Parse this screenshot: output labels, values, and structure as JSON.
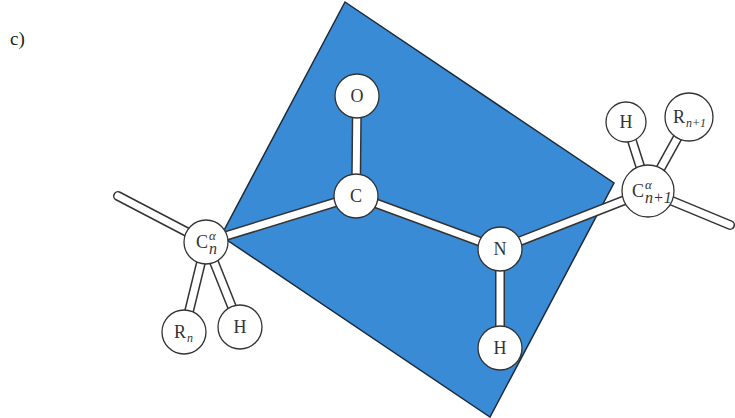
{
  "panel_label": "c)",
  "colors": {
    "peptide_plane": "#3a8bd6",
    "plane_outline": "#1c2a3a",
    "atom_fill": "#ffffff",
    "atom_stroke": "#333333",
    "bond_fill": "#ffffff"
  },
  "plane": {
    "name": "peptide-plane",
    "corners": [
      [
        345,
        2
      ],
      [
        614,
        183
      ],
      [
        490,
        417
      ],
      [
        221,
        236
      ]
    ]
  },
  "atoms": [
    {
      "id": "ca_n",
      "label": "C",
      "sup": "α",
      "sub": "n",
      "x": 206,
      "y": 242,
      "r": 22
    },
    {
      "id": "c",
      "label": "C",
      "x": 356,
      "y": 196,
      "r": 22
    },
    {
      "id": "o",
      "label": "O",
      "x": 357,
      "y": 96,
      "r": 22
    },
    {
      "id": "n",
      "label": "N",
      "x": 500,
      "y": 249,
      "r": 22
    },
    {
      "id": "h_n",
      "label": "H",
      "x": 500,
      "y": 348,
      "r": 22
    },
    {
      "id": "ca_n1",
      "label": "C",
      "sup": "α",
      "sub": "n+1",
      "x": 648,
      "y": 191,
      "r": 26
    },
    {
      "id": "h_can1",
      "label": "H",
      "x": 626,
      "y": 122,
      "r": 20
    },
    {
      "id": "r_n1",
      "label": "R",
      "sub": "n+1",
      "x": 689,
      "y": 117,
      "r": 24
    },
    {
      "id": "r_n",
      "label": "R",
      "sub": "n",
      "x": 184,
      "y": 332,
      "r": 22
    },
    {
      "id": "h_can",
      "label": "H",
      "x": 240,
      "y": 327,
      "r": 22
    }
  ],
  "bonds": [
    {
      "from": "ca_n",
      "to": "c"
    },
    {
      "from": "c",
      "to": "o"
    },
    {
      "from": "c",
      "to": "n"
    },
    {
      "from": "n",
      "to": "h_n"
    },
    {
      "from": "n",
      "to": "ca_n1"
    },
    {
      "from": "ca_n1",
      "to": "h_can1"
    },
    {
      "from": "ca_n1",
      "to": "r_n1"
    },
    {
      "from": "ca_n",
      "to": "r_n"
    },
    {
      "from": "ca_n",
      "to": "h_can"
    }
  ],
  "dangling_bonds": [
    {
      "name": "chain-left",
      "x1": 118,
      "y1": 196,
      "x2": 206,
      "y2": 242
    },
    {
      "name": "chain-right",
      "x1": 648,
      "y1": 191,
      "x2": 730,
      "y2": 225
    }
  ]
}
